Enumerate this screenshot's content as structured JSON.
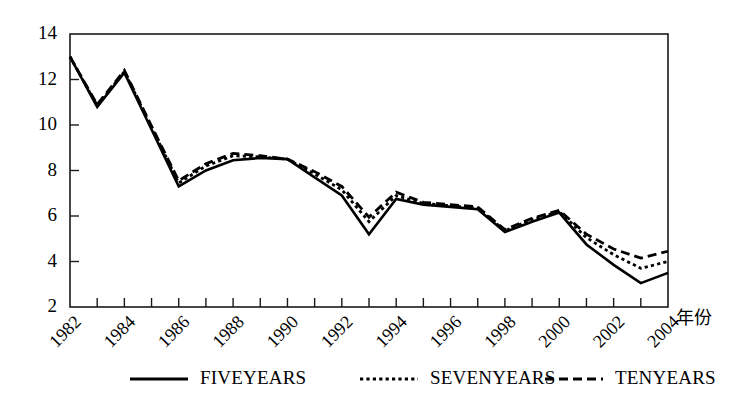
{
  "chart_data": {
    "type": "line",
    "title": "",
    "xlabel": "年份",
    "ylabel": "",
    "xlim": [
      1982,
      2004
    ],
    "ylim": [
      2,
      14
    ],
    "grid": false,
    "legend_position": "bottom",
    "x": [
      1982,
      1983,
      1984,
      1985,
      1986,
      1987,
      1988,
      1989,
      1990,
      1991,
      1992,
      1993,
      1994,
      1995,
      1996,
      1997,
      1998,
      1999,
      2000,
      2001,
      2002,
      2003,
      2004
    ],
    "xtick_labels": [
      "1982",
      "1984",
      "1986",
      "1988",
      "1990",
      "1992",
      "1994",
      "1996",
      "1998",
      "2000",
      "2002",
      "2004"
    ],
    "xtick_values": [
      1982,
      1984,
      1986,
      1988,
      1990,
      1992,
      1994,
      1996,
      1998,
      2000,
      2002,
      2004
    ],
    "ytick_labels": [
      "2",
      "4",
      "6",
      "8",
      "10",
      "12",
      "14"
    ],
    "ytick_values": [
      2,
      4,
      6,
      8,
      10,
      12,
      14
    ],
    "series": [
      {
        "name": "FIVEYEARS",
        "style": "solid",
        "values": [
          13.0,
          10.8,
          12.3,
          9.8,
          7.3,
          8.0,
          8.45,
          8.55,
          8.5,
          7.7,
          6.9,
          5.2,
          6.75,
          6.5,
          6.4,
          6.3,
          5.3,
          5.75,
          6.15,
          4.75,
          3.85,
          3.05,
          3.5
        ]
      },
      {
        "name": "SEVENYEARS",
        "style": "dotted",
        "values": [
          13.0,
          10.85,
          12.35,
          9.9,
          7.45,
          8.2,
          8.65,
          8.6,
          8.5,
          7.85,
          7.15,
          5.75,
          6.9,
          6.55,
          6.45,
          6.35,
          5.35,
          5.85,
          6.2,
          5.05,
          4.3,
          3.7,
          4.0
        ]
      },
      {
        "name": "TENYEARS",
        "style": "dashed",
        "values": [
          13.0,
          10.9,
          12.4,
          9.95,
          7.55,
          8.3,
          8.75,
          8.65,
          8.5,
          7.95,
          7.3,
          5.95,
          7.05,
          6.6,
          6.5,
          6.4,
          5.4,
          5.9,
          6.25,
          5.2,
          4.55,
          4.15,
          4.45
        ]
      }
    ]
  },
  "legend": {
    "items": [
      {
        "label": "FIVEYEARS",
        "style": "solid"
      },
      {
        "label": "SEVENYEARS",
        "style": "dotted"
      },
      {
        "label": "TENYEARS",
        "style": "dashed"
      }
    ]
  }
}
